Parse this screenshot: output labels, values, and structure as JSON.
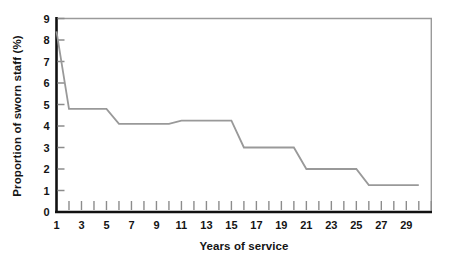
{
  "chart_data": {
    "type": "line",
    "title": "",
    "subtitle": "",
    "xlabel": "Years of service",
    "ylabel": "Proportion of sworn staff (%)",
    "xlim": [
      1,
      31
    ],
    "ylim": [
      0,
      9
    ],
    "grid": false,
    "legend": null,
    "legend_position": "none",
    "x_tick_labels": [
      "1",
      "3",
      "5",
      "7",
      "9",
      "11",
      "13",
      "15",
      "17",
      "19",
      "21",
      "23",
      "25",
      "27",
      "29"
    ],
    "x_tick_values": [
      1,
      3,
      5,
      7,
      9,
      11,
      13,
      15,
      17,
      19,
      21,
      23,
      25,
      27,
      29
    ],
    "x_minor_ticks": [
      1,
      2,
      3,
      4,
      5,
      6,
      7,
      8,
      9,
      10,
      11,
      12,
      13,
      14,
      15,
      16,
      17,
      18,
      19,
      20,
      21,
      22,
      23,
      24,
      25,
      26,
      27,
      28,
      29,
      30,
      31
    ],
    "y_tick_labels": [
      "0",
      "1",
      "2",
      "3",
      "4",
      "5",
      "6",
      "7",
      "8",
      "9"
    ],
    "y_tick_values": [
      0,
      1,
      2,
      3,
      4,
      5,
      6,
      7,
      8,
      9
    ],
    "series": [
      {
        "name": "Proportion of sworn staff",
        "color": "#999999",
        "x": [
          1,
          2,
          5,
          6,
          10,
          11,
          15,
          16,
          20,
          21,
          25,
          26,
          30
        ],
        "values": [
          8.4,
          4.8,
          4.8,
          4.1,
          4.1,
          4.25,
          4.25,
          3.0,
          3.0,
          2.0,
          2.0,
          1.25,
          1.25
        ]
      }
    ]
  },
  "axes": {
    "axis_color": "#111111",
    "border_color": "#9a9a9a",
    "tick_color": "#8c8c8c"
  }
}
